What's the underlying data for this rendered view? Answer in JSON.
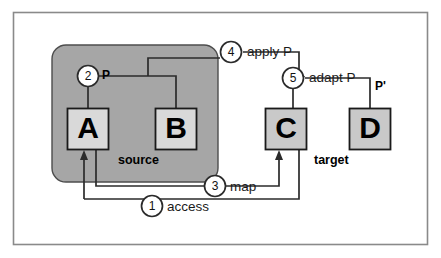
{
  "diagram": {
    "frame": {
      "name": "outer-frame"
    },
    "zones": [
      {
        "id": "source",
        "label": "source",
        "fill": "#a6a6a6"
      },
      {
        "id": "target",
        "label": "target",
        "fill": "#ffffff"
      }
    ],
    "nodes": [
      {
        "id": "A",
        "label": "A",
        "fill": "#d9d9d9"
      },
      {
        "id": "B",
        "label": "B",
        "fill": "#d9d9d9"
      },
      {
        "id": "C",
        "label": "C",
        "fill": "#c9c9c9"
      },
      {
        "id": "D",
        "label": "D",
        "fill": "#c9c9c9"
      }
    ],
    "properties": [
      {
        "id": "P",
        "label": "P"
      },
      {
        "id": "Pprime",
        "label": "P'"
      }
    ],
    "steps": [
      {
        "number": "1",
        "label": "access"
      },
      {
        "number": "2",
        "label": ""
      },
      {
        "number": "3",
        "label": "map"
      },
      {
        "number": "4",
        "label": "apply P"
      },
      {
        "number": "5",
        "label": "adapt P"
      }
    ],
    "colors": {
      "line": "#2b2b2b",
      "node_border": "#1a1a1a",
      "source_fill": "#a6a6a6",
      "node_fill_light": "#d9d9d9",
      "node_fill_gray": "#c9c9c9",
      "frame_border": "#8a8a8a",
      "background": "#ffffff"
    }
  }
}
